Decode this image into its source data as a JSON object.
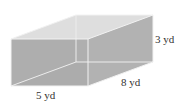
{
  "diagram": {
    "type": "rectangular-prism",
    "dimensions": {
      "length": "5 yd",
      "width": "8 yd",
      "height": "3 yd"
    },
    "labels": {
      "height": "3 yd",
      "depth": "8 yd",
      "length": "5 yd"
    },
    "colors": {
      "front_face": "#a9a9a9",
      "right_face": "#b4b4b4",
      "top_face": "#dcdcdc",
      "back_face": "#e6e6e6",
      "bottom_face": "#d4d4d4",
      "edge": "#f0f0f0"
    }
  }
}
